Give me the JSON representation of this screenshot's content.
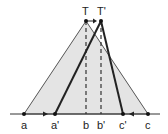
{
  "diagram": {
    "colors": {
      "fill": "#e4e4e4",
      "line": "#333333",
      "thin_line": "#555555",
      "background": "#ffffff"
    },
    "baseline": {
      "y": 114,
      "x1": 10,
      "x2": 160
    },
    "points": {
      "T": {
        "label": "T",
        "x": 86,
        "y": 21
      },
      "T_prime": {
        "label": "T'",
        "x": 101,
        "y": 21
      },
      "a": {
        "label": "a",
        "x": 24,
        "y": 114
      },
      "a_prime": {
        "label": "a'",
        "x": 55,
        "y": 114
      },
      "b": {
        "label": "b",
        "x": 86,
        "y": 114
      },
      "b_prime": {
        "label": "b'",
        "x": 101,
        "y": 114
      },
      "c_prime": {
        "label": "c'",
        "x": 123,
        "y": 114
      },
      "c": {
        "label": "c",
        "x": 148,
        "y": 114
      }
    }
  }
}
